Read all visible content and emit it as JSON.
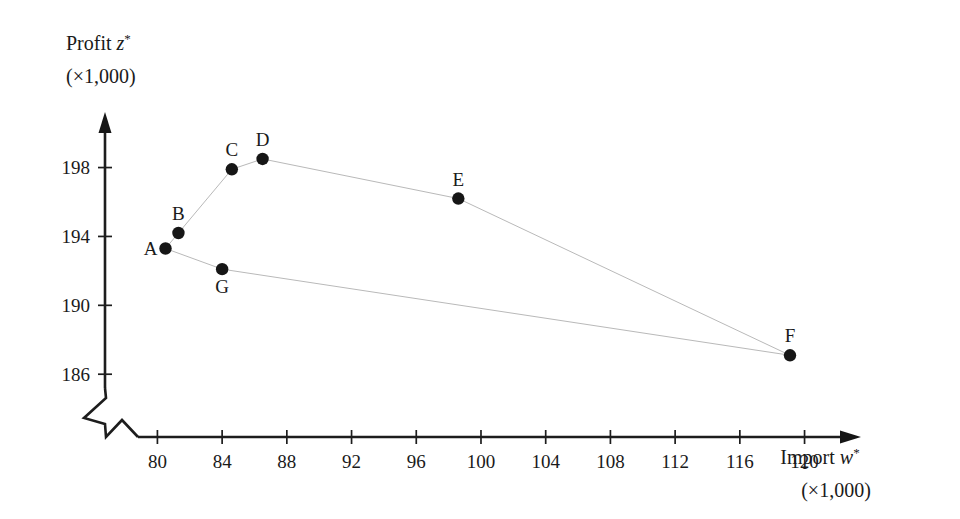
{
  "chart_data": {
    "type": "scatter",
    "title": "",
    "xlabel": "Import w* (×1,000)",
    "ylabel": "Profit z* (×1,000)",
    "xlabel_main": "Import",
    "xlabel_symbol": "w",
    "xlabel_sup": "*",
    "xlabel_unit": "(×1,000)",
    "ylabel_main": "Profit",
    "ylabel_symbol": "z",
    "ylabel_sup": "*",
    "ylabel_unit": "(×1,000)",
    "xlim": [
      78.8,
      122.5
    ],
    "ylim": [
      185.2,
      199.6
    ],
    "xticks": [
      80,
      84,
      88,
      92,
      96,
      100,
      104,
      108,
      112,
      116,
      120
    ],
    "yticks": [
      186,
      190,
      194,
      198
    ],
    "xtick_labels": [
      "80",
      "84",
      "88",
      "92",
      "96",
      "100",
      "104",
      "108",
      "112",
      "116",
      "120"
    ],
    "ytick_labels": [
      "186",
      "190",
      "194",
      "198"
    ],
    "grid": false,
    "legend": "none",
    "axis_break_x": true,
    "axis_break_y": true,
    "points": [
      {
        "label": "A",
        "x": 80.5,
        "y": 193.3,
        "label_pos": "left"
      },
      {
        "label": "B",
        "x": 81.3,
        "y": 194.2,
        "label_pos": "above"
      },
      {
        "label": "C",
        "x": 84.6,
        "y": 197.9,
        "label_pos": "above"
      },
      {
        "label": "D",
        "x": 86.5,
        "y": 198.5,
        "label_pos": "above"
      },
      {
        "label": "E",
        "x": 98.6,
        "y": 196.2,
        "label_pos": "above"
      },
      {
        "label": "F",
        "x": 119.1,
        "y": 187.1,
        "label_pos": "above"
      },
      {
        "label": "G",
        "x": 84.0,
        "y": 192.1,
        "label_pos": "below"
      }
    ],
    "series": [
      {
        "name": "upper-frontier",
        "point_labels": [
          "A",
          "B",
          "C",
          "D",
          "E",
          "F"
        ]
      },
      {
        "name": "lower-frontier",
        "point_labels": [
          "A",
          "G",
          "F"
        ]
      }
    ],
    "colors": {
      "point": "#161616",
      "axis": "#1d1d1d",
      "connector": "#b9b9b9",
      "background": "#ffffff"
    }
  }
}
